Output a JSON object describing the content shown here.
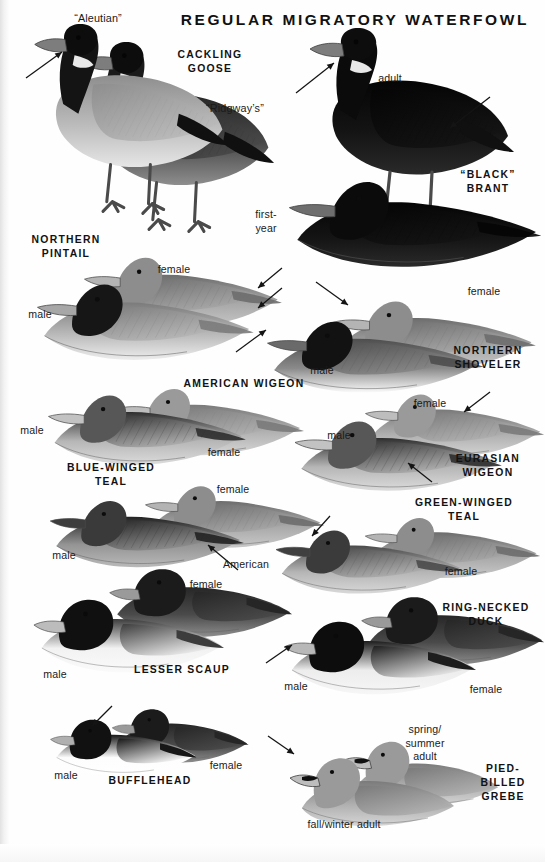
{
  "plate": {
    "title": "REGULAR MIGRATORY\nWATERFOWL",
    "background_color": "#fefefe",
    "ink_color": "#121212"
  },
  "species_labels": [
    {
      "id": "cackling-goose",
      "text": "CACKLING\nGOOSE",
      "x": 155,
      "y": 48,
      "w": 110,
      "align": "center"
    },
    {
      "id": "black-brant",
      "text": "“BLACK”\nBRANT",
      "x": 438,
      "y": 168,
      "w": 100,
      "align": "center"
    },
    {
      "id": "northern-pintail",
      "text": "NORTHERN\nPINTAIL",
      "x": 14,
      "y": 233,
      "w": 104,
      "align": "center"
    },
    {
      "id": "northern-shoveler",
      "text": "NORTHERN\nSHOVELER",
      "x": 434,
      "y": 344,
      "w": 108,
      "align": "center"
    },
    {
      "id": "american-wigeon",
      "text": "AMERICAN WIGEON",
      "x": 160,
      "y": 377,
      "w": 168,
      "align": "center"
    },
    {
      "id": "eurasian-wigeon",
      "text": "EURASIAN\nWIGEON",
      "x": 438,
      "y": 452,
      "w": 100,
      "align": "center"
    },
    {
      "id": "blue-winged-teal",
      "text": "BLUE-WINGED\nTEAL",
      "x": 46,
      "y": 461,
      "w": 130,
      "align": "center"
    },
    {
      "id": "green-winged-teal",
      "text": "GREEN-WINGED\nTEAL",
      "x": 396,
      "y": 496,
      "w": 136,
      "align": "center"
    },
    {
      "id": "lesser-scaup",
      "text": "LESSER SCAUP",
      "x": 112,
      "y": 663,
      "w": 140,
      "align": "center"
    },
    {
      "id": "ring-necked-duck",
      "text": "RING-NECKED\nDUCK",
      "x": 430,
      "y": 601,
      "w": 112,
      "align": "center"
    },
    {
      "id": "bufflehead",
      "text": "BUFFLEHEAD",
      "x": 88,
      "y": 774,
      "w": 124,
      "align": "center"
    },
    {
      "id": "pied-billed-grebe",
      "text": "PIED-\nBILLED\nGREBE",
      "x": 466,
      "y": 762,
      "w": 74,
      "align": "center"
    }
  ],
  "annotations": [
    {
      "id": "aleutian",
      "text": "“Aleutian”",
      "x": 58,
      "y": 12,
      "w": 80,
      "align": "center",
      "quoted": true
    },
    {
      "id": "ridgways",
      "text": "“Ridgway’s”",
      "x": 190,
      "y": 102,
      "w": 90,
      "align": "center",
      "quoted": true
    },
    {
      "id": "brant-adult",
      "text": "adult",
      "x": 364,
      "y": 72,
      "w": 52,
      "align": "center"
    },
    {
      "id": "brant-first-year",
      "text": "first-\nyear",
      "x": 243,
      "y": 208,
      "w": 46,
      "align": "center"
    },
    {
      "id": "pintail-male",
      "text": "male",
      "x": 18,
      "y": 308,
      "w": 44,
      "align": "center"
    },
    {
      "id": "pintail-female",
      "text": "female",
      "x": 148,
      "y": 263,
      "w": 52,
      "align": "center"
    },
    {
      "id": "shoveler-male",
      "text": "male",
      "x": 300,
      "y": 364,
      "w": 44,
      "align": "center"
    },
    {
      "id": "shoveler-female",
      "text": "female",
      "x": 458,
      "y": 285,
      "w": 52,
      "align": "center"
    },
    {
      "id": "amwigeon-male",
      "text": "male",
      "x": 10,
      "y": 424,
      "w": 44,
      "align": "center"
    },
    {
      "id": "amwigeon-female",
      "text": "female",
      "x": 198,
      "y": 446,
      "w": 52,
      "align": "center"
    },
    {
      "id": "euwigeon-male",
      "text": "male",
      "x": 317,
      "y": 429,
      "w": 44,
      "align": "center"
    },
    {
      "id": "euwigeon-female",
      "text": "female",
      "x": 404,
      "y": 397,
      "w": 52,
      "align": "center"
    },
    {
      "id": "bwteal-male",
      "text": "male",
      "x": 42,
      "y": 549,
      "w": 44,
      "align": "center"
    },
    {
      "id": "bwteal-female",
      "text": "female",
      "x": 207,
      "y": 483,
      "w": 52,
      "align": "center"
    },
    {
      "id": "gwteal-american",
      "text": "American",
      "x": 214,
      "y": 558,
      "w": 64,
      "align": "center"
    },
    {
      "id": "gwteal-female",
      "text": "female",
      "x": 435,
      "y": 565,
      "w": 52,
      "align": "center"
    },
    {
      "id": "scaup-male",
      "text": "male",
      "x": 33,
      "y": 668,
      "w": 44,
      "align": "center"
    },
    {
      "id": "scaup-female",
      "text": "female",
      "x": 180,
      "y": 578,
      "w": 52,
      "align": "center"
    },
    {
      "id": "rnduck-male",
      "text": "male",
      "x": 274,
      "y": 680,
      "w": 44,
      "align": "center"
    },
    {
      "id": "rnduck-female",
      "text": "female",
      "x": 460,
      "y": 683,
      "w": 52,
      "align": "center"
    },
    {
      "id": "bufflehead-male",
      "text": "male",
      "x": 44,
      "y": 769,
      "w": 44,
      "align": "center"
    },
    {
      "id": "bufflehead-female",
      "text": "female",
      "x": 200,
      "y": 759,
      "w": 52,
      "align": "center"
    },
    {
      "id": "grebe-spring-summer",
      "text": "spring/\nsummer\nadult",
      "x": 394,
      "y": 723,
      "w": 62,
      "align": "center"
    },
    {
      "id": "grebe-fall-winter",
      "text": "fall/winter adult",
      "x": 290,
      "y": 818,
      "w": 108,
      "align": "center"
    }
  ],
  "pointer_arrows": [
    {
      "id": "arrow-aleutian-head",
      "x1": 26,
      "y1": 78,
      "x2": 62,
      "y2": 52
    },
    {
      "id": "arrow-brant-neck",
      "x1": 296,
      "y1": 93,
      "x2": 334,
      "y2": 63
    },
    {
      "id": "arrow-brant-flank",
      "x1": 490,
      "y1": 97,
      "x2": 450,
      "y2": 128
    },
    {
      "id": "arrow-pintail-tail-a",
      "x1": 282,
      "y1": 268,
      "x2": 258,
      "y2": 288
    },
    {
      "id": "arrow-pintail-tail-b",
      "x1": 282,
      "y1": 288,
      "x2": 258,
      "y2": 308
    },
    {
      "id": "arrow-shoveler-bill",
      "x1": 236,
      "y1": 352,
      "x2": 266,
      "y2": 330
    },
    {
      "id": "arrow-shoveler-female",
      "x1": 316,
      "y1": 282,
      "x2": 348,
      "y2": 305
    },
    {
      "id": "arrow-euwigeon-head",
      "x1": 490,
      "y1": 392,
      "x2": 464,
      "y2": 412
    },
    {
      "id": "arrow-euwigeon-flank",
      "x1": 432,
      "y1": 482,
      "x2": 408,
      "y2": 463
    },
    {
      "id": "arrow-bwteal-flank",
      "x1": 238,
      "y1": 570,
      "x2": 208,
      "y2": 545
    },
    {
      "id": "arrow-gwteal-head",
      "x1": 330,
      "y1": 516,
      "x2": 312,
      "y2": 536
    },
    {
      "id": "arrow-rnduck-bill",
      "x1": 266,
      "y1": 663,
      "x2": 292,
      "y2": 645
    },
    {
      "id": "arrow-bufflehead-head",
      "x1": 112,
      "y1": 706,
      "x2": 92,
      "y2": 726
    },
    {
      "id": "arrow-grebe-bill",
      "x1": 268,
      "y1": 736,
      "x2": 294,
      "y2": 754
    }
  ],
  "figures": [
    {
      "id": "cackling-goose-ridgways",
      "kind": "goose-standing",
      "x": 58,
      "y": 38,
      "w": 218,
      "h": 210,
      "tone": "dark-grey",
      "flip": false
    },
    {
      "id": "cackling-goose-aleutian",
      "kind": "goose-standing",
      "x": 12,
      "y": 20,
      "w": 218,
      "h": 210,
      "tone": "pale-grey",
      "flip": false
    },
    {
      "id": "brant-adult",
      "kind": "goose-standing",
      "x": 286,
      "y": 24,
      "w": 230,
      "h": 215,
      "tone": "black",
      "flip": false
    },
    {
      "id": "brant-first-year",
      "kind": "duck-swimming",
      "x": 276,
      "y": 168,
      "w": 268,
      "h": 110,
      "tone": "black",
      "flip": false
    },
    {
      "id": "pintail-female",
      "kind": "duck-swimming",
      "x": 74,
      "y": 246,
      "w": 210,
      "h": 92,
      "tone": "mid-grey",
      "flip": false
    },
    {
      "id": "pintail-male",
      "kind": "duck-swimming",
      "x": 26,
      "y": 272,
      "w": 230,
      "h": 98,
      "tone": "pintail",
      "flip": false
    },
    {
      "id": "shoveler-female",
      "kind": "duck-swimming",
      "x": 322,
      "y": 290,
      "w": 216,
      "h": 90,
      "tone": "mid-grey",
      "flip": false
    },
    {
      "id": "shoveler-male",
      "kind": "duck-swimming",
      "x": 256,
      "y": 310,
      "w": 230,
      "h": 92,
      "tone": "shoveler",
      "flip": false
    },
    {
      "id": "amwigeon-female",
      "kind": "duck-swimming",
      "x": 106,
      "y": 378,
      "w": 200,
      "h": 86,
      "tone": "warm-grey",
      "flip": false
    },
    {
      "id": "amwigeon-male",
      "kind": "duck-swimming",
      "x": 38,
      "y": 384,
      "w": 210,
      "h": 90,
      "tone": "wigeon",
      "flip": false
    },
    {
      "id": "euwigeon-female",
      "kind": "duck-swimming",
      "x": 356,
      "y": 384,
      "w": 190,
      "h": 82,
      "tone": "warm-grey",
      "flip": false
    },
    {
      "id": "euwigeon-male",
      "kind": "duck-swimming",
      "x": 284,
      "y": 410,
      "w": 220,
      "h": 90,
      "tone": "wigeon",
      "flip": false
    },
    {
      "id": "bwteal-female",
      "kind": "duck-swimming",
      "x": 136,
      "y": 476,
      "w": 190,
      "h": 80,
      "tone": "mid-grey",
      "flip": false
    },
    {
      "id": "bwteal-male",
      "kind": "duck-swimming",
      "x": 40,
      "y": 490,
      "w": 206,
      "h": 86,
      "tone": "bwteal",
      "flip": false
    },
    {
      "id": "gwteal-female",
      "kind": "duck-swimming",
      "x": 356,
      "y": 508,
      "w": 186,
      "h": 78,
      "tone": "mid-grey",
      "flip": false
    },
    {
      "id": "gwteal-male",
      "kind": "duck-swimming",
      "x": 266,
      "y": 520,
      "w": 200,
      "h": 82,
      "tone": "gwteal",
      "flip": false
    },
    {
      "id": "scaup-female",
      "kind": "diving-duck",
      "x": 104,
      "y": 560,
      "w": 190,
      "h": 86,
      "tone": "dark-grey",
      "flip": false
    },
    {
      "id": "scaup-male",
      "kind": "diving-duck",
      "x": 28,
      "y": 590,
      "w": 198,
      "h": 92,
      "tone": "scaup",
      "flip": false
    },
    {
      "id": "rnduck-female",
      "kind": "diving-duck",
      "x": 356,
      "y": 588,
      "w": 190,
      "h": 86,
      "tone": "dark-grey",
      "flip": false
    },
    {
      "id": "rnduck-male",
      "kind": "diving-duck",
      "x": 278,
      "y": 612,
      "w": 200,
      "h": 92,
      "tone": "rnduck",
      "flip": false
    },
    {
      "id": "bufflehead-female",
      "kind": "diving-duck",
      "x": 108,
      "y": 702,
      "w": 142,
      "h": 68,
      "tone": "dark-grey",
      "flip": false
    },
    {
      "id": "bufflehead-male",
      "kind": "diving-duck",
      "x": 46,
      "y": 712,
      "w": 152,
      "h": 72,
      "tone": "bufflehead",
      "flip": false
    },
    {
      "id": "grebe-spring-summer",
      "kind": "grebe",
      "x": 330,
      "y": 730,
      "w": 170,
      "h": 86,
      "tone": "warm-grey",
      "flip": false
    },
    {
      "id": "grebe-fall-winter",
      "kind": "grebe",
      "x": 276,
      "y": 746,
      "w": 180,
      "h": 90,
      "tone": "warm-grey",
      "flip": false
    }
  ]
}
